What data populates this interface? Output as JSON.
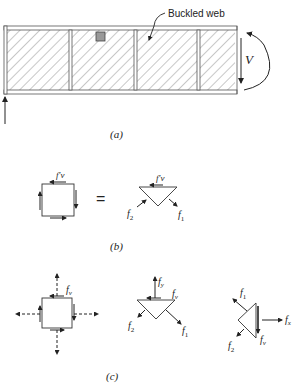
{
  "figure": {
    "panel_a": {
      "caption": "(a)",
      "callout": "Buckled web",
      "shear_label": "V",
      "panels": 4
    },
    "panel_b": {
      "caption": "(b)",
      "equals": "=",
      "square_label": "f′v",
      "triangle_top_label": "f′v",
      "f2_label": "f",
      "f2_sub": "2",
      "f1_label": "f",
      "f1_sub": "1"
    },
    "panel_c": {
      "caption": "(c)",
      "square_label": "f",
      "square_sub": "v",
      "tri1_fy": "f",
      "tri1_fy_sub": "y",
      "tri1_fv": "f",
      "tri1_fv_sub": "v",
      "tri1_f2": "f",
      "tri1_f2_sub": "2",
      "tri1_f1": "f",
      "tri1_f1_sub": "1",
      "tri2_f1": "f",
      "tri2_f1_sub": "1",
      "tri2_fx": "f",
      "tri2_fx_sub": "x",
      "tri2_fv": "f",
      "tri2_fv_sub": "v",
      "tri2_f2": "f",
      "tri2_f2_sub": "2"
    }
  }
}
